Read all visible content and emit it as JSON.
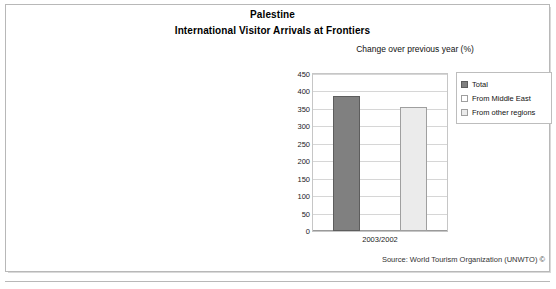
{
  "figure": {
    "title": "Palestine",
    "subtitle": "International Visitor Arrivals at Frontiers",
    "source": "Source: World Tourism Organization (UNWTO) ©"
  },
  "chart_data": {
    "type": "bar",
    "title": "Change over previous year (%)",
    "xlabel": "",
    "ylabel": "",
    "categories": [
      "2003/2002"
    ],
    "ylim": [
      0,
      450
    ],
    "yticks": [
      450,
      400,
      350,
      300,
      250,
      200,
      150,
      100,
      50,
      0
    ],
    "grid": true,
    "legend_position": "right",
    "series": [
      {
        "name": "Total",
        "values": [
          388
        ],
        "color": "#808080"
      },
      {
        "name": "From Middle East",
        "values": [
          null
        ],
        "color": "#ffffff"
      },
      {
        "name": "From other regions",
        "values": [
          355
        ],
        "color": "#ebebeb"
      }
    ]
  }
}
